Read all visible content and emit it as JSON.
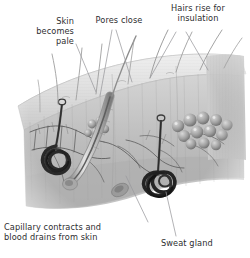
{
  "figure": {
    "background_color": "#ffffff",
    "text_color": "#2e2e30",
    "illustration_tone": "grayscale"
  },
  "labels": {
    "skin_pale": "Skin\nbecomes\npale",
    "pores_close": "Pores close",
    "hairs_rise": "Hairs rise for\ninsulation",
    "capillary": "Capillary contracts and\nblood drains from skin",
    "sweat_gland": "Sweat gland"
  },
  "leader_lines": {
    "color": "#9a9a9e",
    "count": 7
  },
  "illustration": {
    "name": "skin-cross-section",
    "features": [
      "epidermis-surface",
      "hair-shafts",
      "hair-follicle",
      "sebaceous-gland",
      "sweat-gland-coil-left",
      "sweat-gland-coil-right",
      "capillary-network",
      "fat-cell-cluster",
      "dermis-layer"
    ]
  }
}
